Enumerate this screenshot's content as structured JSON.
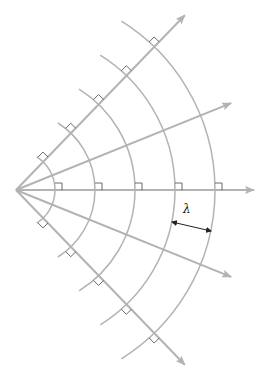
{
  "label": {
    "wavelength_symbol": "λ"
  },
  "rays": {
    "count": 5,
    "angles_deg": [
      -46,
      -22,
      0,
      22,
      46
    ]
  },
  "wavefronts": {
    "count": 5,
    "spacing_label": "λ"
  },
  "colors": {
    "ray": "#b3b3b3",
    "wavefront": "#b3b3b3",
    "right_angle_marker": "#444444",
    "dimension_arrow": "#222222"
  }
}
